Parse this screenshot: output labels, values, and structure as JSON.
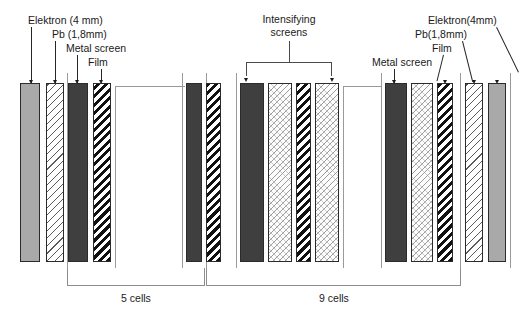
{
  "diagram": {
    "left_labels": [
      {
        "text": "Elektron (4 mm)",
        "x": 28,
        "y": 14
      },
      {
        "text": "Pb (1,8mm)",
        "x": 52,
        "y": 29
      },
      {
        "text": "Metal screen",
        "x": 66,
        "y": 43
      },
      {
        "text": "Film",
        "x": 88,
        "y": 57
      }
    ],
    "center_label": {
      "line1": "Intensifying",
      "line2": "screens",
      "x": 243,
      "y": 13
    },
    "right_labels": [
      {
        "text": "Elektron(4mm)",
        "x": 428,
        "y": 14
      },
      {
        "text": "Pb(1,8mm)",
        "x": 415,
        "y": 28
      },
      {
        "text": "Film",
        "x": 432,
        "y": 42
      },
      {
        "text": "Metal screen",
        "x": 372,
        "y": 56
      }
    ],
    "brackets": [
      {
        "name": "5 cells",
        "label": "5 cells",
        "x": 67,
        "width": 138,
        "label_x": 136,
        "label_y": 292
      },
      {
        "name": "9 cells",
        "label": "9 cells",
        "x": 206,
        "width": 255,
        "label_x": 334,
        "label_y": 292
      }
    ],
    "materials": {
      "elektron": {
        "name": "Elektron",
        "thickness": "4 mm",
        "color": "#a9a9a9"
      },
      "pb": {
        "name": "Pb",
        "thickness": "1,8mm",
        "color": "#ffffff"
      },
      "metal_screen": {
        "name": "Metal screen",
        "color": "#3f3f3f"
      },
      "film": {
        "name": "Film",
        "color": "#111111"
      },
      "intensifying_screen": {
        "name": "Intensifying screen",
        "color": "#fdfdfd"
      }
    },
    "layers": [
      {
        "name": "elektron",
        "type": "t-elektron",
        "x": 20,
        "w": 20
      },
      {
        "name": "pb",
        "type": "t-pb",
        "x": 46,
        "w": 18
      },
      {
        "name": "metal-screen",
        "type": "t-metal",
        "x": 68,
        "w": 20
      },
      {
        "name": "film",
        "type": "t-film",
        "x": 93,
        "w": 18
      },
      {
        "name": "metal-screen",
        "type": "t-metal",
        "x": 186,
        "w": 16
      },
      {
        "name": "film",
        "type": "t-film",
        "x": 206,
        "w": 15
      },
      {
        "name": "metal-screen",
        "type": "t-metal",
        "x": 240,
        "w": 24
      },
      {
        "name": "intensifying-screen",
        "type": "t-screen",
        "x": 268,
        "w": 24
      },
      {
        "name": "film",
        "type": "t-film",
        "x": 296,
        "w": 15
      },
      {
        "name": "intensifying-screen",
        "type": "t-screen",
        "x": 315,
        "w": 24
      },
      {
        "name": "metal-screen",
        "type": "t-metal",
        "x": 385,
        "w": 22
      },
      {
        "name": "intensifying-screen",
        "type": "t-screen",
        "x": 411,
        "w": 22
      },
      {
        "name": "film",
        "type": "t-film",
        "x": 437,
        "w": 16
      },
      {
        "name": "intensifying-screen",
        "type": "t-screen",
        "x": 457,
        "w": 22
      },
      {
        "name": "pb",
        "type": "t-pb",
        "x": 465,
        "w": 18
      },
      {
        "name": "elektron",
        "type": "t-elektron",
        "x": 488,
        "w": 18
      }
    ]
  }
}
